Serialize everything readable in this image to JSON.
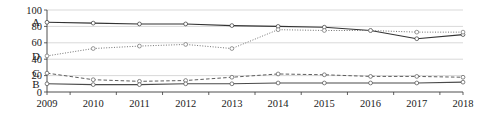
{
  "chart_data": {
    "type": "line",
    "title": "",
    "xlabel": "",
    "ylabel": "",
    "categories": [
      "2009",
      "2010",
      "2011",
      "2012",
      "2013",
      "2014",
      "2015",
      "2016",
      "2017",
      "2018"
    ],
    "ylim": [
      0,
      100
    ],
    "yticks": [
      0,
      20,
      40,
      60,
      80,
      100
    ],
    "ytick_labels": [
      "0",
      "20",
      "40",
      "60",
      "80",
      "100"
    ],
    "grid": true,
    "legend_position": "inline-left",
    "series": [
      {
        "name": "A",
        "label": "A",
        "style": "solid",
        "color": "#333333",
        "values": [
          85,
          84,
          83,
          83,
          81,
          80,
          79,
          75,
          65,
          70
        ]
      },
      {
        "name": "D",
        "label": "D",
        "style": "dotted",
        "color": "#6b6b6b",
        "values": [
          44,
          53,
          56,
          58,
          53,
          76,
          75,
          75,
          73,
          73
        ]
      },
      {
        "name": "C",
        "label": "C",
        "style": "dashed",
        "color": "#555555",
        "values": [
          23,
          15,
          13,
          14,
          18,
          22,
          21,
          19,
          19,
          18
        ]
      },
      {
        "name": "B",
        "label": "B",
        "style": "solid",
        "color": "#4a4a4a",
        "values": [
          10,
          9,
          9,
          10,
          10,
          11,
          11,
          11,
          11,
          12
        ]
      }
    ]
  },
  "axes": {
    "y_axis_name": "y-axis",
    "x_axis_name": "x-axis"
  }
}
